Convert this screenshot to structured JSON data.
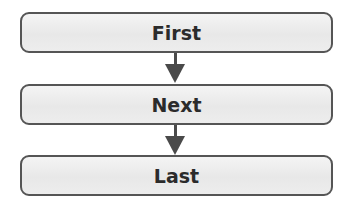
{
  "diagram": {
    "type": "flowchart",
    "nodes": [
      {
        "id": "first",
        "label": "First"
      },
      {
        "id": "next",
        "label": "Next"
      },
      {
        "id": "last",
        "label": "Last"
      }
    ],
    "edges": [
      {
        "from": "first",
        "to": "next"
      },
      {
        "from": "next",
        "to": "last"
      }
    ],
    "colors": {
      "border": "#555555",
      "fill": "#ececec",
      "arrow": "#4a4a4a",
      "text": "#2b2b2b"
    }
  }
}
